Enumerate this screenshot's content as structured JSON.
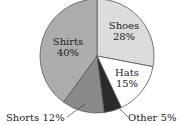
{
  "chart_data": {
    "type": "pie",
    "title": "",
    "start_angle": "12 o'clock",
    "direction": "clockwise",
    "categories": [
      "Shoes",
      "Hats",
      "Other",
      "Shorts",
      "Shirts"
    ],
    "values": [
      28,
      15,
      5,
      12,
      40
    ],
    "unit": "%",
    "slices": [
      {
        "name": "Shoes",
        "value": 28,
        "label_line1": "Shoes",
        "label_line2": "28%",
        "color": "#dcdcdc",
        "label_position": "inside"
      },
      {
        "name": "Hats",
        "value": 15,
        "label_line1": "Hats",
        "label_line2": "15%",
        "color": "#ffffff",
        "label_position": "inside"
      },
      {
        "name": "Other",
        "value": 5,
        "label_line1": "Other 5%",
        "label_line2": "",
        "color": "#2a2a2a",
        "label_position": "outside-callout"
      },
      {
        "name": "Shorts",
        "value": 12,
        "label_line1": "Shorts 12%",
        "label_line2": "",
        "color": "#8a8a8a",
        "label_position": "outside-callout"
      },
      {
        "name": "Shirts",
        "value": 40,
        "label_line1": "Shirts",
        "label_line2": "40%",
        "color": "#adadad",
        "label_position": "inside"
      }
    ],
    "legend": "none",
    "border_color": "#555555"
  }
}
